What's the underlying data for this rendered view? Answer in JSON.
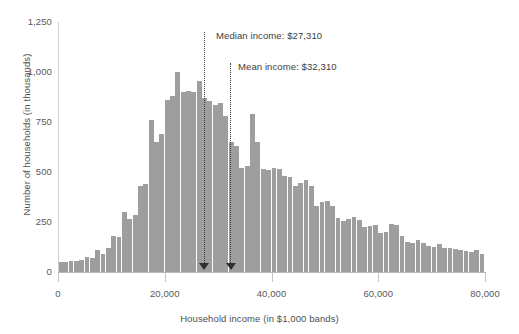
{
  "chart_data": {
    "type": "bar",
    "title": "",
    "subtitle": "",
    "xlabel": "Household income (in $1,000 bands)",
    "ylabel": "Number of households (in thousands)",
    "xlim": [
      0,
      80000
    ],
    "ylim": [
      0,
      1250
    ],
    "grid": false,
    "legend": null,
    "bar_color": "#9e9e9e",
    "bin_width": 1000,
    "x_ticks": [
      0,
      20000,
      40000,
      60000,
      80000
    ],
    "x_tick_labels": [
      "0",
      "20,000",
      "40,000",
      "60,000",
      "80,000"
    ],
    "y_ticks": [
      0,
      250,
      500,
      750,
      1000,
      1250
    ],
    "y_tick_labels": [
      "0",
      "250",
      "500",
      "750",
      "1,000",
      "1,250"
    ],
    "categories": [
      500,
      1500,
      2500,
      3500,
      4500,
      5500,
      6500,
      7500,
      8500,
      9500,
      10500,
      11500,
      12500,
      13500,
      14500,
      15500,
      16500,
      17500,
      18500,
      19500,
      20500,
      21500,
      22500,
      23500,
      24500,
      25500,
      26500,
      27500,
      28500,
      29500,
      30500,
      31500,
      32500,
      33500,
      34500,
      35500,
      36500,
      37500,
      38500,
      39500,
      40500,
      41500,
      42500,
      43500,
      44500,
      45500,
      46500,
      47500,
      48500,
      49500,
      50500,
      51500,
      52500,
      53500,
      54500,
      55500,
      56500,
      57500,
      58500,
      59500,
      60500,
      61500,
      62500,
      63500,
      64500,
      65500,
      66500,
      67500,
      68500,
      69500,
      70500,
      71500,
      72500,
      73500,
      74500,
      75500,
      76500,
      77500,
      78500,
      79500
    ],
    "values": [
      50,
      50,
      55,
      55,
      60,
      75,
      70,
      110,
      90,
      120,
      180,
      175,
      300,
      265,
      285,
      430,
      440,
      760,
      650,
      690,
      860,
      880,
      1000,
      900,
      905,
      900,
      955,
      870,
      855,
      835,
      845,
      780,
      650,
      630,
      520,
      530,
      790,
      650,
      515,
      510,
      520,
      515,
      480,
      475,
      430,
      445,
      460,
      430,
      330,
      350,
      355,
      330,
      270,
      255,
      265,
      275,
      260,
      225,
      230,
      235,
      195,
      200,
      240,
      235,
      180,
      150,
      145,
      160,
      145,
      130,
      125,
      140,
      120,
      120,
      115,
      110,
      105,
      100,
      110,
      90
    ],
    "annotations": [
      {
        "name": "median-income",
        "label": "Median income: $27,310",
        "x": 27310,
        "label_offset_px": {
          "left": 216,
          "top": 30
        },
        "line_top_px": 32,
        "line_bottom_px": 263
      },
      {
        "name": "mean-income",
        "label": "Mean income: $32,310",
        "x": 32310,
        "label_offset_px": {
          "left": 238,
          "top": 61
        },
        "line_top_px": 63,
        "line_bottom_px": 263
      }
    ]
  }
}
